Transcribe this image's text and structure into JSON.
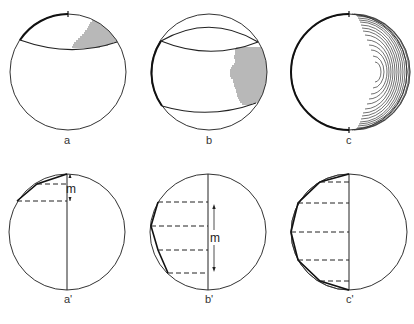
{
  "figure": {
    "panels": [
      {
        "id": "a",
        "label": "a",
        "row": "top",
        "hatching": "cap segment upper-right"
      },
      {
        "id": "b",
        "label": "b",
        "row": "top",
        "hatching": "band segment right"
      },
      {
        "id": "c",
        "label": "c",
        "row": "top",
        "hatching": "concentric arcs right half"
      },
      {
        "id": "a_prime",
        "label": "a'",
        "row": "bottom",
        "measure_label": "m"
      },
      {
        "id": "b_prime",
        "label": "b'",
        "row": "bottom",
        "measure_label": "m"
      },
      {
        "id": "c_prime",
        "label": "c'",
        "row": "bottom"
      }
    ],
    "colors": {
      "stroke": "#222222",
      "thin_stroke": "#444444",
      "background": "#ffffff"
    }
  }
}
